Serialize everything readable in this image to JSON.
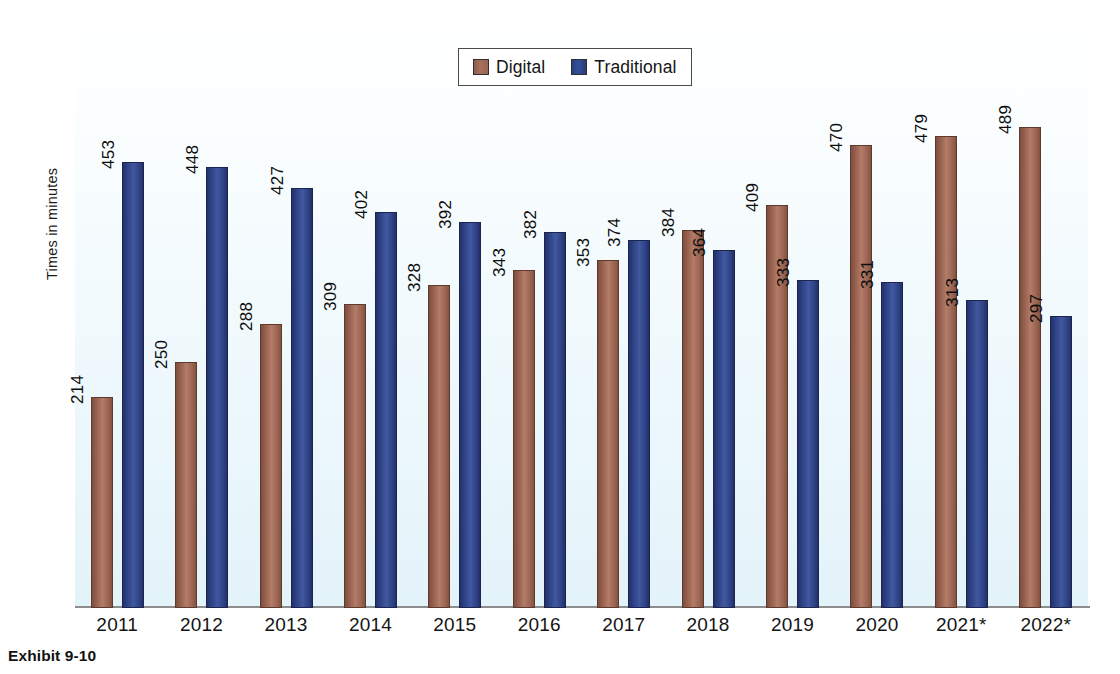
{
  "caption": "Exhibit 9-10",
  "axis": {
    "ylabel": "Times in minutes"
  },
  "legend": {
    "items": [
      {
        "label": "Digital",
        "color": "#a8705d",
        "key": "digital"
      },
      {
        "label": "Traditional",
        "color": "#33509b",
        "key": "traditional"
      }
    ]
  },
  "chart_data": {
    "type": "bar",
    "title": "Exhibit 9-10",
    "xlabel": "",
    "ylabel": "Times in minutes",
    "ylim": [
      0,
      520
    ],
    "grid": false,
    "legend_position": "top-center",
    "categories": [
      "2011",
      "2012",
      "2013",
      "2014",
      "2015",
      "2016",
      "2017",
      "2018",
      "2019",
      "2020",
      "2021*",
      "2022*"
    ],
    "series": [
      {
        "name": "Digital",
        "color": "#a8705d",
        "values": [
          214,
          250,
          288,
          309,
          328,
          343,
          353,
          384,
          409,
          470,
          479,
          489
        ]
      },
      {
        "name": "Traditional",
        "color": "#33509b",
        "values": [
          453,
          448,
          427,
          402,
          392,
          382,
          374,
          364,
          333,
          331,
          313,
          297
        ]
      }
    ]
  }
}
